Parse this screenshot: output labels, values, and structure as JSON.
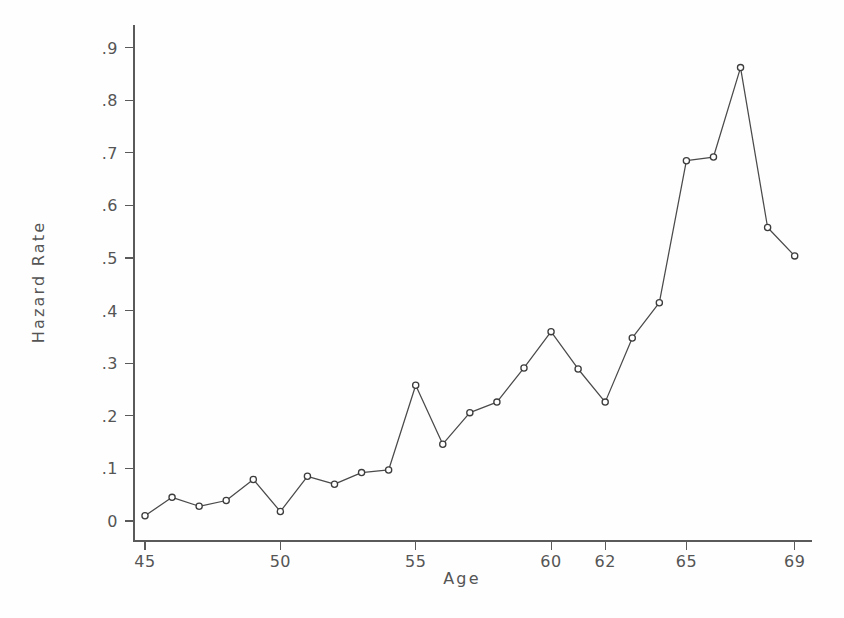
{
  "chart_data": {
    "type": "line",
    "title": "",
    "xlabel": "Age",
    "ylabel": "Hazard Rate",
    "xlim": [
      44.4,
      69.6
    ],
    "ylim": [
      -0.02,
      0.94
    ],
    "grid": false,
    "legend": "none",
    "marker": "open-circle",
    "line_color": "#4a4a4a",
    "marker_color": "#3c3c3c",
    "xticks": [
      45,
      50,
      55,
      60,
      62,
      65,
      69
    ],
    "xtick_labels": [
      "45",
      "50",
      "55",
      "60",
      "62",
      "65",
      "69"
    ],
    "yticks": [
      0,
      0.1,
      0.2,
      0.3,
      0.4,
      0.5,
      0.6,
      0.7,
      0.8,
      0.9
    ],
    "ytick_labels": [
      "0",
      ".1",
      ".2",
      ".3",
      ".4",
      ".5",
      ".6",
      ".7",
      ".8",
      ".9"
    ],
    "x": [
      45,
      46,
      47,
      48,
      49,
      50,
      51,
      52,
      53,
      54,
      55,
      56,
      57,
      58,
      59,
      60,
      61,
      62,
      63,
      64,
      65,
      66,
      67,
      68,
      69
    ],
    "values": [
      0.01,
      0.045,
      0.028,
      0.039,
      0.079,
      0.018,
      0.085,
      0.07,
      0.092,
      0.097,
      0.258,
      0.146,
      0.206,
      0.226,
      0.291,
      0.36,
      0.289,
      0.226,
      0.348,
      0.415,
      0.685,
      0.692,
      0.862,
      0.558,
      0.504
    ],
    "series_name": "Hazard Rate"
  }
}
